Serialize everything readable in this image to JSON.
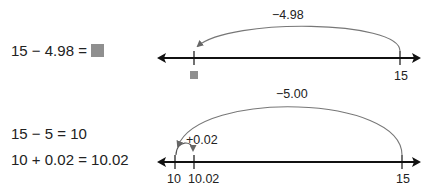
{
  "problem": {
    "equation": "15 − 4.98 = ",
    "unknown_symbol": "gray-square",
    "number_line": {
      "jump_label": "−4.98",
      "ticks": [
        {
          "label": "",
          "unknown": true
        },
        {
          "label": "15"
        }
      ]
    }
  },
  "solution": {
    "steps": [
      "15 − 5 = 10",
      "10 + 0.02 = 10.02"
    ],
    "number_line": {
      "big_jump_label": "−5.00",
      "small_jump_label": "+0.02",
      "ticks": [
        {
          "label": "10"
        },
        {
          "label": "10.02"
        },
        {
          "label": "15"
        }
      ]
    }
  },
  "colors": {
    "line": "#111111",
    "arc": "#777777",
    "unknown_square": "#8f8f8f"
  }
}
